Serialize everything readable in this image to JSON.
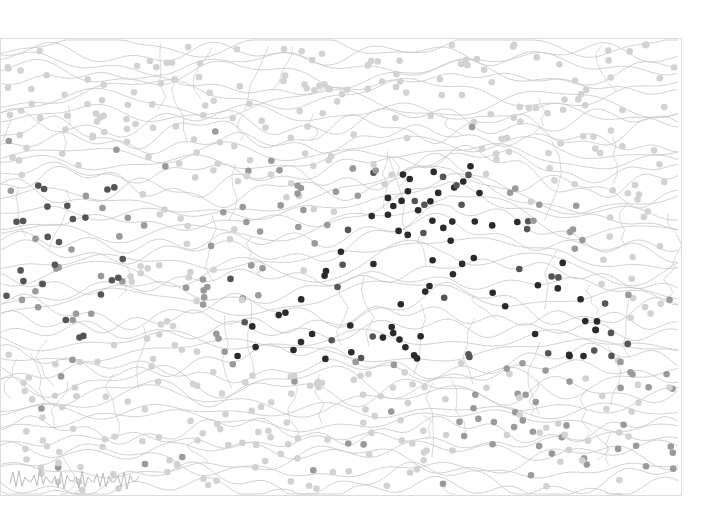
{
  "artwork": {
    "description": "Abstract drawing of wavy grey contour lines forming a topographic-like landscape, overlaid with scattered dots in various shades of grey; darker dots cluster along a mountain-like ridge in the center and a wave shape on the left.",
    "canvas": {
      "width": 704,
      "height": 522
    },
    "frame": {
      "x": 0,
      "y": 38,
      "width": 682,
      "height": 458,
      "border_color": "#dddddd"
    },
    "colors": {
      "background": "#ffffff",
      "line": "#c8c8c8",
      "dot_light": "#d2d2d2",
      "dot_mid": "#9a9a9a",
      "dot_dark": "#555555",
      "dot_darkest": "#2a2a2a"
    },
    "signature": {
      "x": 10,
      "y": 462,
      "width": 130,
      "height": 30,
      "color": "#bbbbbb"
    },
    "dot_count": 620,
    "contour_count": 46
  }
}
